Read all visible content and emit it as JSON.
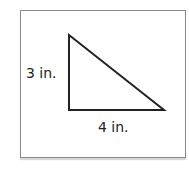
{
  "figure": {
    "shape": "right-triangle",
    "labels": {
      "vertical_leg": "3 in.",
      "horizontal_leg": "4 in."
    },
    "vertices": {
      "top": [
        69,
        35
      ],
      "bottom_left": [
        69,
        110
      ],
      "bottom_right": [
        164,
        110
      ]
    },
    "stroke_color": "#222222",
    "frame_color": "#8a8a8a"
  }
}
